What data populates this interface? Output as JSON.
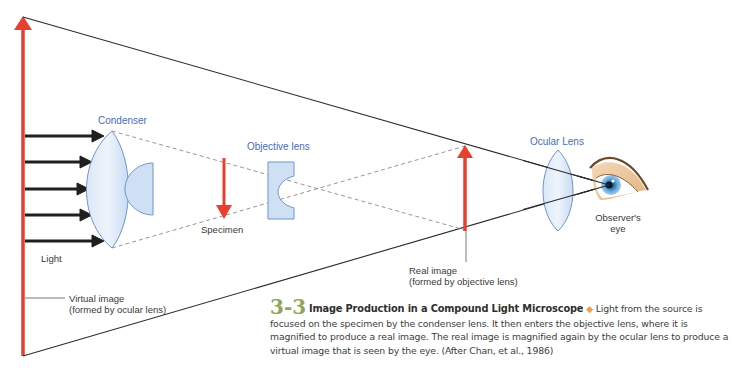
{
  "figure": {
    "number": "3-3",
    "title": "Image Production in a Compound Light Microscope",
    "separator_icon": "diamond-bullet-icon",
    "caption_body": "Light from the source is focused on the specimen by the condenser lens. It then enters the objective lens, where it is magnified to produce a real image. The real image is magnified again by the ocular lens to produce a virtual image that is seen by the eye. (After Chan, et al., 1986)"
  },
  "labels": {
    "condenser": "Condenser",
    "objective_lens": "Objective lens",
    "ocular_lens": "Ocular Lens",
    "specimen": "Specimen",
    "light": "Light",
    "observer_line1": "Observer's",
    "observer_line2": "eye",
    "real_image_line1": "Real image",
    "real_image_line2": "(formed by objective lens)",
    "virtual_image_line1": "Virtual image",
    "virtual_image_line2": "(formed by ocular lens)"
  },
  "colors": {
    "arrow_red": "#e8402e",
    "lens_fill": "#cfe0f5",
    "lens_stroke": "#6f95cc",
    "label_blue": "#4a6db3",
    "ray_black": "#2a2a2a",
    "dashed_gray": "#8a8a8a",
    "figure_number_green": "#8ea85a",
    "diamond_orange": "#e8a04c"
  }
}
